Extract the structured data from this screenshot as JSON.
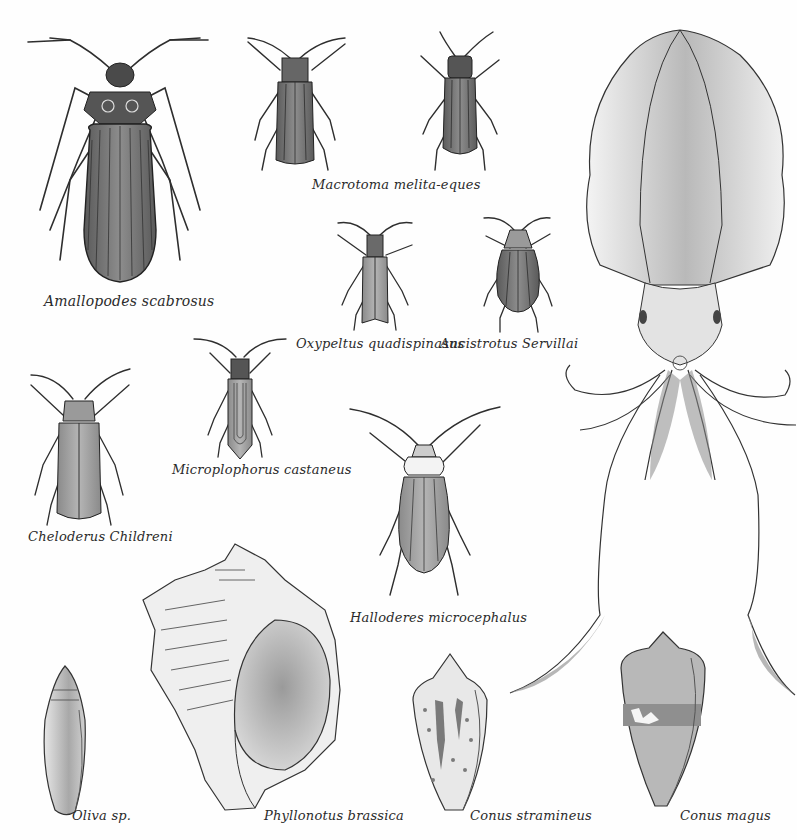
{
  "plate": {
    "background": "#fefefe",
    "ink_color": "#2e2e2e",
    "wash_color": "#8a8a8a"
  },
  "specimens": {
    "amallopodes": {
      "kind": "beetle",
      "label": "Amallopodes scabrosus"
    },
    "macrotoma_a": {
      "kind": "beetle",
      "label": ""
    },
    "macrotoma_b": {
      "kind": "beetle",
      "label": ""
    },
    "macrotoma_caption": {
      "label": "Macrotoma melita-eques"
    },
    "oxypeltus": {
      "kind": "beetle",
      "label": "Oxypeltus quadispinasus"
    },
    "ancistrotus": {
      "kind": "beetle",
      "label": "Ancistrotus Servillai"
    },
    "cheloderus": {
      "kind": "beetle",
      "label": "Cheloderus Childreni"
    },
    "microplophorus": {
      "kind": "beetle",
      "label": "Microplophorus castaneus"
    },
    "halloderes": {
      "kind": "beetle",
      "label": "Halloderes microcephalus"
    },
    "squid": {
      "kind": "cephalopod",
      "label": ""
    },
    "oliva": {
      "kind": "shell",
      "label": "Oliva sp."
    },
    "phyllonotus": {
      "kind": "shell",
      "label": "Phyllonotus brassica"
    },
    "conus_stramineus": {
      "kind": "shell",
      "label": "Conus stramineus"
    },
    "conus_magus": {
      "kind": "shell",
      "label": "Conus magus"
    }
  }
}
